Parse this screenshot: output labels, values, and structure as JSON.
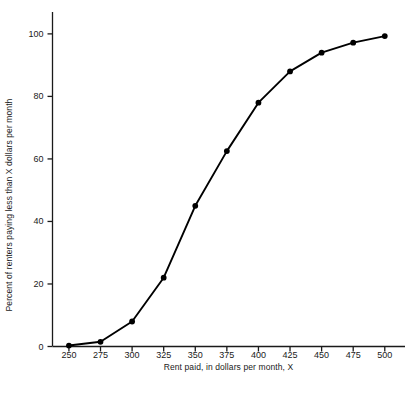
{
  "chart_data": {
    "type": "line",
    "title": "",
    "subtitle": "",
    "xlabel": "Rent paid, in dollars per month, X",
    "ylabel": "Percent of renters paying less than X dollars per month",
    "x": [
      250,
      275,
      300,
      325,
      350,
      375,
      400,
      425,
      450,
      475,
      500
    ],
    "values": [
      0.3,
      1.5,
      8.0,
      22.0,
      45.0,
      62.5,
      78.0,
      88.0,
      94.0,
      97.2,
      99.3
    ],
    "series": [
      {
        "name": "Cumulative percent of renters",
        "values": [
          0.3,
          1.5,
          8.0,
          22.0,
          45.0,
          62.5,
          78.0,
          88.0,
          94.0,
          97.2,
          99.3
        ]
      }
    ],
    "xlim": [
      237,
      516
    ],
    "ylim": [
      0,
      107
    ],
    "xticks": [
      250,
      275,
      300,
      325,
      350,
      375,
      400,
      425,
      450,
      475,
      500
    ],
    "xtick_labels": [
      "250",
      "275",
      "300",
      "325",
      "350",
      "375",
      "400",
      "425",
      "450",
      "475",
      "500"
    ],
    "yticks": [
      0,
      20,
      40,
      60,
      80,
      100
    ],
    "ytick_labels": [
      "0",
      "20",
      "40",
      "60",
      "80",
      "100"
    ],
    "grid": false,
    "legend": "none",
    "marker": "filled-circle",
    "line_color": "#000000",
    "marker_color": "#000000",
    "axis_color": "#1a1a1a",
    "background_color": "#ffffff",
    "annotations": []
  },
  "figure": {
    "caption": ""
  }
}
